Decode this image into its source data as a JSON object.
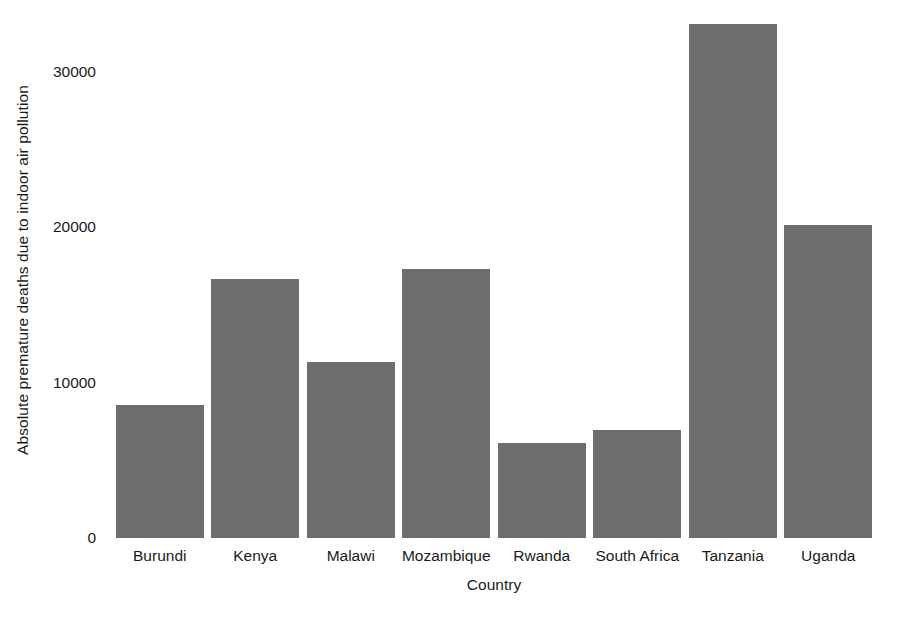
{
  "chart_data": {
    "type": "bar",
    "title": "",
    "subtitle": "",
    "xlabel": "Country",
    "ylabel": "Absolute premature deaths due to indoor air pollution",
    "categories": [
      "Burundi",
      "Kenya",
      "Malawi",
      "Mozambique",
      "Rwanda",
      "South Africa",
      "Tanzania",
      "Uganda"
    ],
    "values": [
      8550,
      16650,
      11350,
      17300,
      6130,
      6950,
      33100,
      20150
    ],
    "ylim": [
      0,
      34000
    ],
    "yticks": [
      0,
      10000,
      20000,
      30000
    ],
    "ytick_labels": [
      "0",
      "10000",
      "20000",
      "30000"
    ],
    "grid": false,
    "legend": null,
    "bar_color": "#6e6e6e",
    "background_color": "#ffffff",
    "text_color": "#1a1a1a",
    "annotations": []
  }
}
